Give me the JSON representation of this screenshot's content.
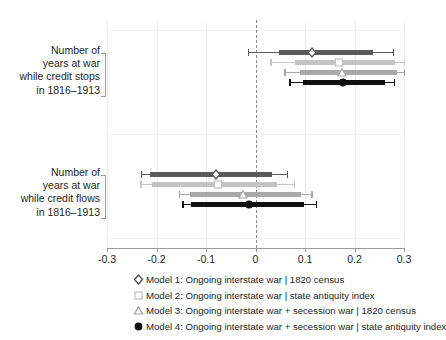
{
  "chart_data": {
    "type": "scatter",
    "title": "",
    "xlabel": "",
    "ylabel": "",
    "xlim": [
      -0.3,
      0.3
    ],
    "xticks": [
      -0.3,
      -0.2,
      -0.1,
      0,
      0.1,
      0.2,
      0.3
    ],
    "xtick_labels": [
      "-0.3",
      "-0.2",
      "-0.1",
      "0",
      "0.1",
      "0.2",
      "0.3"
    ],
    "grid": true,
    "legend_position": "bottom",
    "reference_line": 0,
    "categories": [
      "Number of years at war while credit stops in 1816–1913",
      "Number of years at war while credit flows in 1816–1913"
    ],
    "series": [
      {
        "name": "Model 1: Ongoing interstate war | 1820 census",
        "marker": "diamond",
        "color": "#5a5a5a",
        "points": [
          {
            "category": 0,
            "estimate": 0.115,
            "ci_inner": [
              0.047,
              0.238
            ],
            "ci_outer": [
              -0.015,
              0.277
            ]
          },
          {
            "category": 1,
            "estimate": -0.08,
            "ci_inner": [
              -0.213,
              0.033
            ],
            "ci_outer": [
              -0.232,
              0.063
            ]
          }
        ]
      },
      {
        "name": "Model 2: Ongoing interstate war | state antiquity index",
        "marker": "square",
        "color": "#c4c4c4",
        "points": [
          {
            "category": 0,
            "estimate": 0.168,
            "ci_inner": [
              0.079,
              0.281
            ],
            "ci_outer": [
              0.03,
              0.3
            ]
          },
          {
            "category": 1,
            "estimate": -0.075,
            "ci_inner": [
              -0.21,
              0.043
            ],
            "ci_outer": [
              -0.233,
              0.077
            ]
          }
        ]
      },
      {
        "name": "Model 3: Ongoing interstate war + secession war | 1820 census",
        "marker": "triangle",
        "color": "#a8a8a8",
        "points": [
          {
            "category": 0,
            "estimate": 0.175,
            "ci_inner": [
              0.09,
              0.285
            ],
            "ci_outer": [
              0.058,
              0.3
            ]
          },
          {
            "category": 1,
            "estimate": -0.025,
            "ci_inner": [
              -0.133,
              0.092
            ],
            "ci_outer": [
              -0.155,
              0.113
            ]
          }
        ]
      },
      {
        "name": "Model 4: Ongoing interstate war + secession war | state antiquity index",
        "marker": "circle",
        "color": "#111111",
        "points": [
          {
            "category": 0,
            "estimate": 0.177,
            "ci_inner": [
              0.095,
              0.262
            ],
            "ci_outer": [
              0.068,
              0.28
            ]
          },
          {
            "category": 1,
            "estimate": -0.013,
            "ci_inner": [
              -0.13,
              0.098
            ],
            "ci_outer": [
              -0.148,
              0.122
            ]
          }
        ]
      }
    ]
  },
  "axis": {
    "ticks": [
      {
        "value": -0.3,
        "label": "-0.3"
      },
      {
        "value": -0.2,
        "label": "-0.2"
      },
      {
        "value": -0.1,
        "label": "-0.1"
      },
      {
        "value": 0,
        "label": "0"
      },
      {
        "value": 0.1,
        "label": "0.1"
      },
      {
        "value": 0.2,
        "label": "0.2"
      },
      {
        "value": 0.3,
        "label": "0.3"
      }
    ]
  },
  "y_categories": [
    {
      "lines": [
        "Number of",
        "years at war",
        "while credit stops",
        "in 1816–1913"
      ]
    },
    {
      "lines": [
        "Number of",
        "years at war",
        "while credit flows",
        "in 1816–1913"
      ]
    }
  ],
  "legend": {
    "items": [
      {
        "key": "diamond-marker-icon",
        "label": "Model 1: Ongoing interstate war | 1820 census",
        "color": "#4a4a4a"
      },
      {
        "key": "square-marker-icon",
        "label": "Model 2: Ongoing interstate war | state antiquity index",
        "color": "#bdbdbd"
      },
      {
        "key": "triangle-marker-icon",
        "label": "Model 3: Ongoing interstate war + secession war | 1820 census",
        "color": "#a0a0a0"
      },
      {
        "key": "circle-marker-icon",
        "label": "Model 4: Ongoing interstate war + secession war | state antiquity index",
        "color": "#111111"
      }
    ]
  },
  "colors": {
    "background": "#ffffff",
    "text": "#231f20",
    "axis": "#9a9a9a",
    "grid": "#ededed",
    "zero_line": "#8a8a8a"
  }
}
